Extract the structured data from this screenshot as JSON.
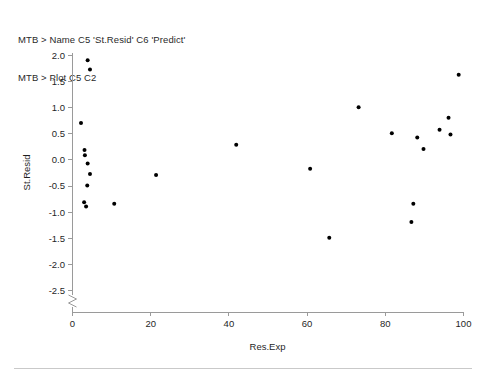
{
  "session": {
    "lines": [
      "MTB > Name C5 'St.Resid' C6 'Predict'",
      "MTB > Plot C5 C2"
    ]
  },
  "colors": {
    "point": "#000000",
    "axis": "#9a9a9a",
    "text": "#1f1f1f",
    "background": "#ffffff",
    "rule": "#c9c9c9"
  },
  "chart_data": {
    "type": "scatter",
    "title": "",
    "xlabel": "Res.Exp",
    "ylabel": "St.Resid",
    "xlim": [
      0,
      100
    ],
    "ylim": [
      -2.5,
      2.0
    ],
    "xticks": [
      0,
      20,
      40,
      60,
      80,
      100
    ],
    "xticklabels": [
      "0",
      "20",
      "40",
      "60",
      "80",
      "100"
    ],
    "yticks": [
      -2.5,
      -2.0,
      -1.5,
      -1.0,
      -0.5,
      0.0,
      0.5,
      1.0,
      1.5,
      2.0
    ],
    "yticklabels": [
      "-2.5",
      "-2.0",
      "-1.5",
      "-1.0",
      "-0.5",
      "0.0",
      "0.5",
      "1.0",
      "1.5",
      "2.0"
    ],
    "grid": false,
    "legend": null,
    "y_axis_break": true,
    "y_axis_break_below": -2.5,
    "marker": "filled-circle",
    "marker_size": 3,
    "n_points": 25,
    "points": [
      {
        "x": 4.0,
        "y": 1.9
      },
      {
        "x": 4.6,
        "y": 1.72
      },
      {
        "x": 2.3,
        "y": 0.7
      },
      {
        "x": 3.2,
        "y": 0.18
      },
      {
        "x": 3.3,
        "y": 0.08
      },
      {
        "x": 4.0,
        "y": -0.08
      },
      {
        "x": 4.6,
        "y": -0.28
      },
      {
        "x": 3.9,
        "y": -0.5
      },
      {
        "x": 3.1,
        "y": -0.82
      },
      {
        "x": 3.6,
        "y": -0.9
      },
      {
        "x": 10.8,
        "y": -0.85
      },
      {
        "x": 21.5,
        "y": -0.3
      },
      {
        "x": 42.0,
        "y": 0.28
      },
      {
        "x": 60.9,
        "y": -0.18
      },
      {
        "x": 65.8,
        "y": -1.5
      },
      {
        "x": 73.3,
        "y": 1.0
      },
      {
        "x": 81.8,
        "y": 0.5
      },
      {
        "x": 86.8,
        "y": -1.2
      },
      {
        "x": 87.3,
        "y": -0.85
      },
      {
        "x": 88.3,
        "y": 0.42
      },
      {
        "x": 89.9,
        "y": 0.2
      },
      {
        "x": 94.0,
        "y": 0.57
      },
      {
        "x": 96.3,
        "y": 0.8
      },
      {
        "x": 96.8,
        "y": 0.48
      },
      {
        "x": 98.9,
        "y": 1.62
      }
    ]
  }
}
